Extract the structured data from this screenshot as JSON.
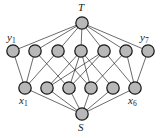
{
  "figure": {
    "type": "bipartite-flow-network",
    "caption": "",
    "colors": {
      "node_fill": "#b8b8b8",
      "node_stroke": "#1a1a1a",
      "edge_stroke": "#2b2b2b",
      "background": "#ffffff",
      "label_color": "#1a1a1a"
    }
  },
  "labels": {
    "sink": "T",
    "source": "S",
    "y_first_base": "y",
    "y_first_sub": "1",
    "y_last_base": "y",
    "y_last_sub": "7",
    "x_first_base": "x",
    "x_first_sub": "1",
    "x_last_base": "x",
    "x_last_sub": "6"
  },
  "graph_data": {
    "node_radius": 6.2,
    "sink_node": {
      "id": "T",
      "x": 82,
      "y": 23
    },
    "source_node": {
      "id": "S",
      "x": 82,
      "y": 114
    },
    "y_nodes": [
      {
        "id": "y1",
        "x": 13,
        "y": 51
      },
      {
        "id": "y2",
        "x": 35,
        "y": 51
      },
      {
        "id": "y3",
        "x": 58,
        "y": 51
      },
      {
        "id": "y4",
        "x": 81,
        "y": 51
      },
      {
        "id": "y5",
        "x": 104,
        "y": 51
      },
      {
        "id": "y6",
        "x": 126,
        "y": 51
      },
      {
        "id": "y7",
        "x": 148,
        "y": 51
      }
    ],
    "x_nodes": [
      {
        "id": "x1",
        "x": 25,
        "y": 88
      },
      {
        "id": "x2",
        "x": 47,
        "y": 88
      },
      {
        "id": "x3",
        "x": 69,
        "y": 88
      },
      {
        "id": "x4",
        "x": 91,
        "y": 88
      },
      {
        "id": "x5",
        "x": 113,
        "y": 88
      },
      {
        "id": "x6",
        "x": 135,
        "y": 88
      }
    ],
    "sink_edges": [
      [
        "T",
        "y1"
      ],
      [
        "T",
        "y2"
      ],
      [
        "T",
        "y3"
      ],
      [
        "T",
        "y4"
      ],
      [
        "T",
        "y5"
      ],
      [
        "T",
        "y6"
      ],
      [
        "T",
        "y7"
      ]
    ],
    "source_edges": [
      [
        "S",
        "x1"
      ],
      [
        "S",
        "x2"
      ],
      [
        "S",
        "x3"
      ],
      [
        "S",
        "x4"
      ],
      [
        "S",
        "x5"
      ],
      [
        "S",
        "x6"
      ]
    ],
    "bipartite_edges": [
      [
        "y1",
        "x1"
      ],
      [
        "y2",
        "x1"
      ],
      [
        "y2",
        "x3"
      ],
      [
        "y3",
        "x1"
      ],
      [
        "y3",
        "x4"
      ],
      [
        "y4",
        "x2"
      ],
      [
        "y4",
        "x3"
      ],
      [
        "y4",
        "x4"
      ],
      [
        "y4",
        "x5"
      ],
      [
        "y5",
        "x2"
      ],
      [
        "y5",
        "x3"
      ],
      [
        "y5",
        "x6"
      ],
      [
        "y6",
        "x4"
      ],
      [
        "y6",
        "x6"
      ],
      [
        "y7",
        "x6"
      ]
    ]
  },
  "label_positions": {
    "sink": {
      "x": 78,
      "y": 2
    },
    "source": {
      "x": 78,
      "y": 122
    },
    "y_first": {
      "x": 7,
      "y": 32
    },
    "y_last": {
      "x": 140,
      "y": 32
    },
    "x_first": {
      "x": 19,
      "y": 95
    },
    "x_last": {
      "x": 128,
      "y": 95
    }
  }
}
